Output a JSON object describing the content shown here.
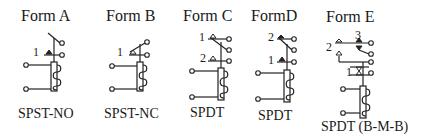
{
  "diagram": {
    "forms": [
      {
        "title": "Form A",
        "caption": "SPST-NO",
        "labels": [
          "1"
        ]
      },
      {
        "title": "Form B",
        "caption": "SPST-NC",
        "labels": [
          "1"
        ]
      },
      {
        "title": "Form C",
        "caption": "SPDT",
        "labels": [
          "1",
          "2"
        ]
      },
      {
        "title": "FormD",
        "caption": "SPDT",
        "labels": [
          "2",
          "1"
        ]
      },
      {
        "title": "Form E",
        "caption": "SPDT (B-M-B)",
        "labels": [
          "3",
          "2",
          "1"
        ]
      }
    ]
  }
}
